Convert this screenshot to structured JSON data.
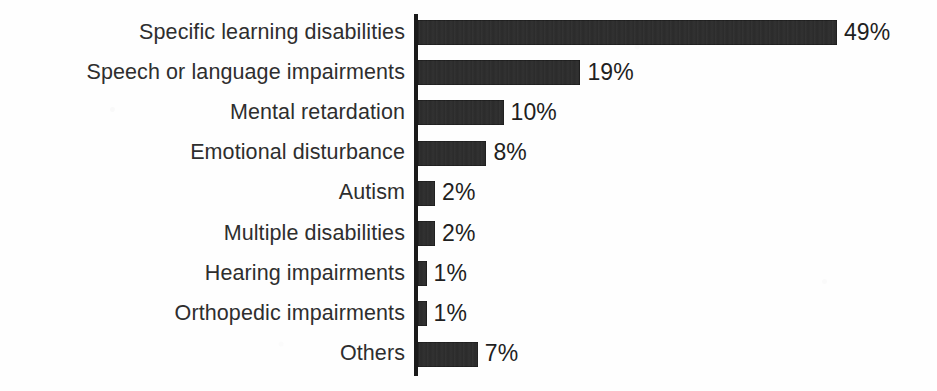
{
  "chart_data": {
    "type": "bar",
    "orientation": "horizontal",
    "title": "",
    "subtitle": "",
    "xlabel": "",
    "ylabel": "",
    "grid": false,
    "legend": false,
    "legend_position": "none",
    "xlim": [
      0,
      49
    ],
    "axis_spine": "left",
    "value_label_suffix": "%",
    "bar_color": "#2b2b2b",
    "label_color": "#2e2e2e",
    "axis_color": "#1a1a1a",
    "background_color": "#ffffff",
    "categories": [
      "Specific learning disabilities",
      "Speech or language impairments",
      "Mental retardation",
      "Emotional disturbance",
      "Autism",
      "Multiple disabilities",
      "Hearing impairments",
      "Orthopedic impairments",
      "Others"
    ],
    "values": [
      49,
      19,
      10,
      8,
      2,
      2,
      1,
      1,
      7
    ],
    "value_labels": [
      "49%",
      "19%",
      "10%",
      "8%",
      "2%",
      "2%",
      "1%",
      "1%",
      "7%"
    ],
    "rows": [
      {
        "label": "Specific learning disabilities",
        "value": 49,
        "value_label": "49%"
      },
      {
        "label": "Speech or language impairments",
        "value": 19,
        "value_label": "19%"
      },
      {
        "label": "Mental retardation",
        "value": 10,
        "value_label": "10%"
      },
      {
        "label": "Emotional disturbance",
        "value": 8,
        "value_label": "8%"
      },
      {
        "label": "Autism",
        "value": 2,
        "value_label": "2%"
      },
      {
        "label": "Multiple disabilities",
        "value": 2,
        "value_label": "2%"
      },
      {
        "label": "Hearing impairments",
        "value": 1,
        "value_label": "1%"
      },
      {
        "label": "Orthopedic impairments",
        "value": 1,
        "value_label": "1%"
      },
      {
        "label": "Others",
        "value": 7,
        "value_label": "7%"
      }
    ]
  },
  "geometry": {
    "axis_x": 414,
    "axis_top": 14,
    "axis_bottom": 376,
    "axis_width": 4,
    "px_per_percent": 8.55,
    "bar_height": 25,
    "row_pitch": 40.2,
    "first_row_top": 20,
    "value_label_gap": 7,
    "label_right_edge": 405
  }
}
